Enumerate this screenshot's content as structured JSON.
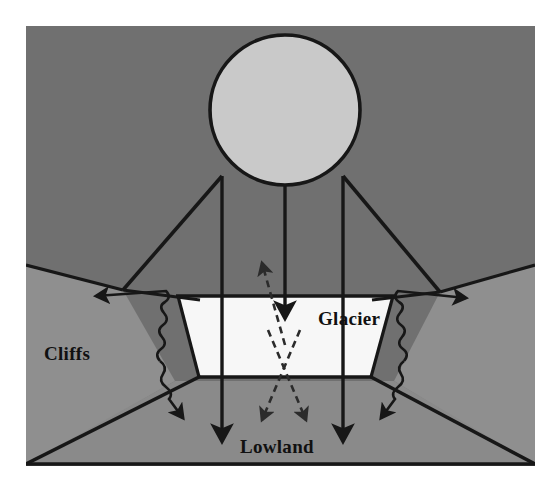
{
  "figure": {
    "kind": "cross-section-schematic",
    "canvas": {
      "width": 560,
      "height": 490
    },
    "plate": {
      "x": 26,
      "y": 26,
      "width": 509,
      "height": 440
    }
  },
  "labels": {
    "cliffs": "Cliffs",
    "glacier": "Glacier",
    "lowland": "Lowland"
  },
  "colors": {
    "page_background": "#ffffff",
    "sky_upper": "#707070",
    "midground_slope": "#8f8f8f",
    "lowland_floor": "#8a8a8a",
    "glacier_fill": "#f7f7f7",
    "source_circle_fill": "#c9c9c9",
    "stroke": "#171717",
    "dashed_stroke": "#2b2b2b"
  },
  "elements": {
    "source_circle": {
      "name": "radiation-source-circle",
      "cx": 285,
      "cy": 110,
      "r": 75
    },
    "solid_beams": [
      {
        "name": "beam-left-outer",
        "x": 222,
        "y_top": 176,
        "y_bottom": 441
      },
      {
        "name": "beam-center",
        "x": 285,
        "y_top": 185,
        "y_bottom": 421
      },
      {
        "name": "beam-right-outer",
        "x": 343,
        "y_top": 176,
        "y_bottom": 441
      }
    ],
    "dashed_rays": [
      {
        "name": "scatter-ray-up-left",
        "direction": "up"
      },
      {
        "name": "scatter-ray-down-center",
        "direction": "down"
      },
      {
        "name": "scatter-ray-down-left",
        "direction": "down-left"
      },
      {
        "name": "scatter-ray-down-right",
        "direction": "down-right"
      }
    ],
    "wavy_arrows": [
      {
        "name": "wavy-emission-left-upper",
        "side": "left",
        "direction": "up-left"
      },
      {
        "name": "wavy-emission-left-lower",
        "side": "left",
        "direction": "down-right"
      },
      {
        "name": "wavy-emission-right-upper",
        "side": "right",
        "direction": "up-right"
      },
      {
        "name": "wavy-emission-right-lower",
        "side": "right",
        "direction": "down-left"
      }
    ],
    "glacier_trapezoid": {
      "name": "glacier-surface",
      "top_left_x": 178,
      "top_right_x": 393,
      "bottom_left_x": 199,
      "bottom_right_x": 371,
      "top_y": 296,
      "bottom_y": 377
    }
  },
  "label_positions": {
    "cliffs": {
      "x": 44,
      "y": 360
    },
    "glacier": {
      "x": 318,
      "y": 325
    },
    "lowland": {
      "x": 240,
      "y": 453
    }
  }
}
